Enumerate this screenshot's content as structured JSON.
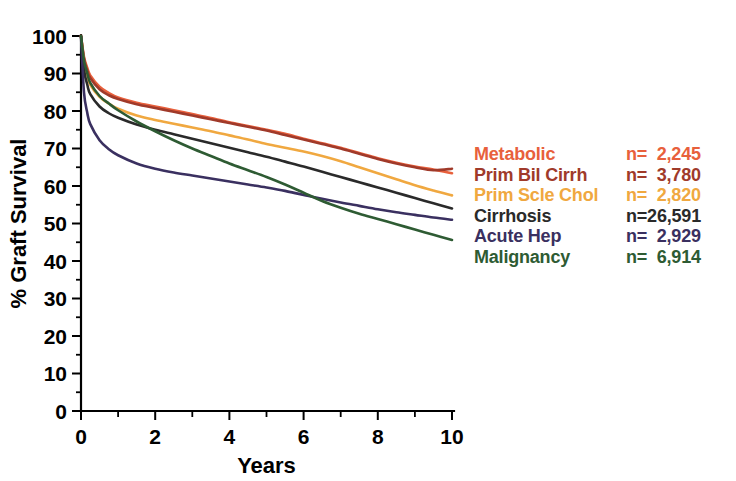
{
  "chart_data": {
    "type": "line",
    "title": "",
    "xlabel": "Years",
    "ylabel": "% Graft Survival",
    "xlim": [
      0,
      10
    ],
    "ylim": [
      0,
      100
    ],
    "xticks": [
      0,
      1,
      2,
      3,
      4,
      5,
      6,
      7,
      8,
      9,
      10
    ],
    "xtick_labels": [
      "0",
      "",
      "2",
      "",
      "4",
      "",
      "6",
      "",
      "8",
      "",
      "10"
    ],
    "yticks": [
      0,
      10,
      20,
      30,
      40,
      50,
      60,
      70,
      80,
      90,
      100
    ],
    "ytick_labels": [
      "0",
      "10",
      "20",
      "30",
      "40",
      "50",
      "60",
      "70",
      "80",
      "90",
      "100"
    ],
    "grid": false,
    "legend_position": "right",
    "x": [
      0,
      0.08,
      0.17,
      0.25,
      0.5,
      0.75,
      1,
      1.5,
      2,
      2.5,
      3,
      3.5,
      4,
      4.5,
      5,
      5.5,
      6,
      6.5,
      7,
      7.5,
      8,
      8.5,
      9,
      9.5,
      10
    ],
    "series": [
      {
        "name": "Metabolic",
        "n_label": "n=  2,245",
        "n_value": 2245,
        "color": "#E8603C",
        "values": [
          100,
          94.5,
          91.5,
          89.5,
          86.5,
          84.8,
          83.6,
          82.2,
          81.2,
          80.2,
          79.2,
          78.1,
          77.0,
          76.0,
          75.0,
          73.9,
          72.6,
          71.4,
          70.2,
          68.8,
          67.4,
          66.2,
          65.2,
          64.4,
          63.4
        ]
      },
      {
        "name": "Prim Bil Cirrh",
        "n_label": "n=  3,780",
        "n_value": 3780,
        "color": "#A03A2A",
        "values": [
          100,
          94.0,
          90.8,
          88.8,
          85.8,
          84.2,
          83.2,
          81.8,
          80.8,
          79.8,
          78.8,
          77.8,
          76.8,
          75.8,
          74.8,
          73.6,
          72.4,
          71.2,
          70.0,
          68.6,
          67.2,
          66.0,
          65.0,
          64.2,
          64.6
        ]
      },
      {
        "name": "Prim Scle Chol",
        "n_label": "n=  2,820",
        "n_value": 2820,
        "color": "#F0A840",
        "values": [
          100,
          93.0,
          89.5,
          87.0,
          83.8,
          82.0,
          80.6,
          78.8,
          77.6,
          76.6,
          75.6,
          74.6,
          73.5,
          72.4,
          71.2,
          70.2,
          69.2,
          68.0,
          66.6,
          65.0,
          63.4,
          61.8,
          60.2,
          58.8,
          57.5
        ]
      },
      {
        "name": "Cirrhosis",
        "n_label": "n=26,591",
        "n_value": 26591,
        "color": "#2A2A2A",
        "values": [
          100,
          91.0,
          87.0,
          84.5,
          81.2,
          79.4,
          78.2,
          76.4,
          75.0,
          73.8,
          72.6,
          71.4,
          70.2,
          69.0,
          67.8,
          66.5,
          65.2,
          63.8,
          62.4,
          61.0,
          59.6,
          58.2,
          56.8,
          55.4,
          54.0
        ]
      },
      {
        "name": "Acute Hep",
        "n_label": "n=  2,929",
        "n_value": 2929,
        "color": "#3A3060",
        "values": [
          100,
          85.0,
          79.5,
          76.5,
          72.2,
          69.8,
          68.2,
          66.0,
          64.6,
          63.6,
          62.8,
          62.0,
          61.2,
          60.4,
          59.6,
          58.7,
          57.6,
          56.6,
          55.6,
          54.7,
          53.8,
          53.0,
          52.3,
          51.6,
          51.0
        ]
      },
      {
        "name": "Malignancy",
        "n_label": "n=  6,914",
        "n_value": 6914,
        "color": "#2E5B33",
        "values": [
          100,
          93.5,
          90.0,
          87.5,
          84.0,
          82.0,
          80.2,
          77.2,
          74.6,
          72.2,
          70.0,
          68.0,
          66.0,
          64.2,
          62.4,
          60.4,
          58.2,
          56.0,
          54.2,
          52.6,
          51.2,
          49.8,
          48.4,
          47.0,
          45.6
        ]
      }
    ]
  },
  "legend": {
    "rows": [
      {
        "label": "Metabolic",
        "n": "n=  2,245"
      },
      {
        "label": "Prim Bil Cirrh",
        "n": "n=  3,780"
      },
      {
        "label": "Prim Scle Chol",
        "n": "n=  2,820"
      },
      {
        "label": "Cirrhosis",
        "n": "n=26,591"
      },
      {
        "label": "Acute Hep",
        "n": "n=  2,929"
      },
      {
        "label": "Malignancy",
        "n": "n=  6,914"
      }
    ]
  },
  "colors": {
    "metabolic": "#E8603C",
    "prim_bil_cirrh": "#A03A2A",
    "prim_scle_chol": "#F0A840",
    "cirrhosis": "#2A2A2A",
    "acute_hep": "#3A3060",
    "malignancy": "#2E5B33",
    "axis": "#000000",
    "background": "#FFFFFF"
  }
}
